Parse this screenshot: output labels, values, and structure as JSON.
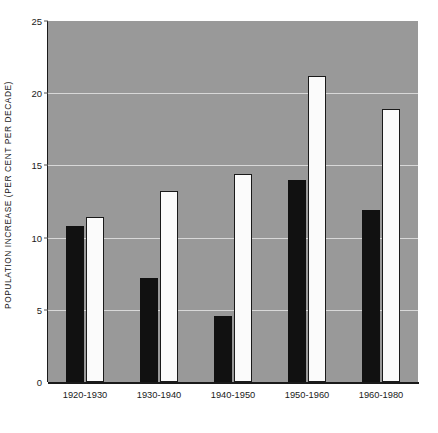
{
  "chart_data": {
    "type": "bar",
    "title": "",
    "xlabel": "",
    "ylabel": "POPULATION INCREASE (PER CENT PER DECADE)",
    "categories": [
      "1920-1930",
      "1930-1940",
      "1940-1950",
      "1950-1960",
      "1960-1980"
    ],
    "series": [
      {
        "name": "black",
        "color": "#111111",
        "values": [
          10.8,
          7.2,
          4.6,
          14.0,
          11.9
        ]
      },
      {
        "name": "white",
        "color": "#fbfbfb",
        "values": [
          11.4,
          13.2,
          14.4,
          21.2,
          18.9
        ]
      }
    ],
    "ylim": [
      0,
      25
    ],
    "yticks": [
      0,
      5,
      10,
      15,
      20,
      25
    ],
    "ytick_labels": [
      "0",
      "5",
      "10",
      "15",
      "20",
      "25"
    ],
    "grid": true,
    "gridline_values": [
      5,
      10,
      15,
      20
    ],
    "legend": "none",
    "plot_background": "#999999",
    "gridline_color": "#d8d8d8",
    "axis_color": "#1a1a1a"
  }
}
